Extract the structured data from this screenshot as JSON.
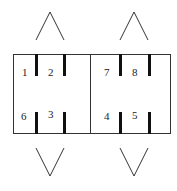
{
  "diagram": {
    "labels": [
      {
        "id": "1",
        "text": "1"
      },
      {
        "id": "2",
        "text": "2"
      },
      {
        "id": "6",
        "text": "6"
      },
      {
        "id": "3",
        "text": "3"
      },
      {
        "id": "7",
        "text": "7"
      },
      {
        "id": "8",
        "text": "8"
      },
      {
        "id": "4",
        "text": "4"
      },
      {
        "id": "5",
        "text": "5"
      }
    ],
    "arrows": {
      "top_left": "up-chevron",
      "top_right": "up-chevron",
      "bottom_left": "down-chevron",
      "bottom_right": "down-chevron"
    },
    "colors": {
      "stroke": "#333333",
      "bar": "#111111",
      "text": "#222222"
    }
  }
}
